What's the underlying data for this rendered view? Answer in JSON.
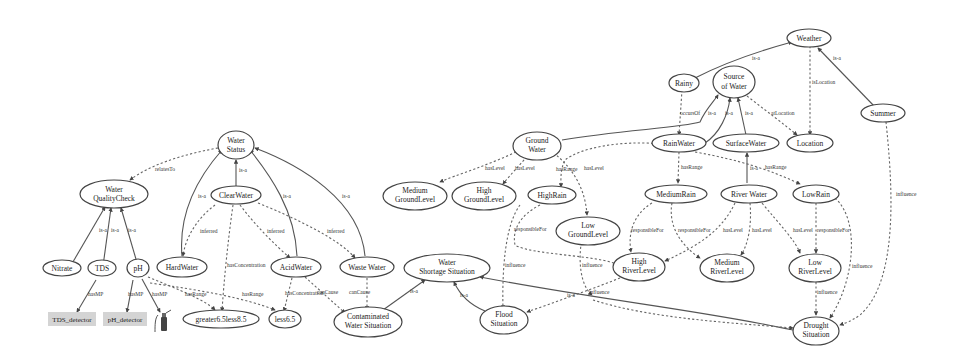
{
  "diagram": {
    "nodes": {
      "water_quality_check": [
        "Water",
        "QualityCheck"
      ],
      "water_status": [
        "Water",
        "Status"
      ],
      "clear_water": [
        "ClearWater"
      ],
      "hard_water": [
        "HardWater"
      ],
      "acid_water": [
        "AcidWater"
      ],
      "waste_water": [
        "Waste Water"
      ],
      "nitrate": [
        "Nitrate"
      ],
      "tds": [
        "TDS"
      ],
      "ph": [
        "pH"
      ],
      "greater6_5less8_5": [
        "greater6.5less8.5"
      ],
      "less6_5": [
        "less6.5"
      ],
      "contaminated_water_situation": [
        "Contaminated",
        "Water Situation"
      ],
      "water_shortage_situation": [
        "Water",
        "Shortage Situation"
      ],
      "flood_situation": [
        "Flood",
        "Situation"
      ],
      "drought_situation": [
        "Drought",
        "Situation"
      ],
      "ground_water": [
        "Ground",
        "Water"
      ],
      "medium_ground_level": [
        "Medium",
        "GroundLevel"
      ],
      "high_ground_level": [
        "High",
        "GroundLevel"
      ],
      "low_ground_level": [
        "Low",
        "GroundLevel"
      ],
      "high_rain": [
        "HighRain"
      ],
      "medium_rain": [
        "MediumRain"
      ],
      "low_rain": [
        "LowRain"
      ],
      "river_water": [
        "River Water"
      ],
      "rain_water": [
        "RainWater"
      ],
      "surface_water": [
        "SurfaceWater"
      ],
      "source_of_water": [
        "Source",
        "of Water"
      ],
      "location": [
        "Location"
      ],
      "rainy": [
        "Rainy"
      ],
      "weather": [
        "Weather"
      ],
      "summer": [
        "Summer"
      ],
      "high_river_level": [
        "High",
        "RiverLevel"
      ],
      "medium_river_level": [
        "Medium",
        "RiverLevel"
      ],
      "low_river_level": [
        "Low",
        "RiverLevel"
      ]
    },
    "boxes": {
      "tds_detector": "TDS_detector",
      "ph_detector": "pH_detector"
    },
    "edge_labels": {
      "is_a": "is-a",
      "relates_to": "relatesTo",
      "inferred": "inferred",
      "has_concentration": "hasConcentration",
      "has_range": "hasRange",
      "has_mp": "hasMP",
      "causes": "canCause",
      "has_level": "hasLevel",
      "responsible_for": "responsibleFor",
      "influence": "influence",
      "occurs_of": "occursOf",
      "at_location": "atLocation",
      "is_location": "isLocation"
    }
  }
}
